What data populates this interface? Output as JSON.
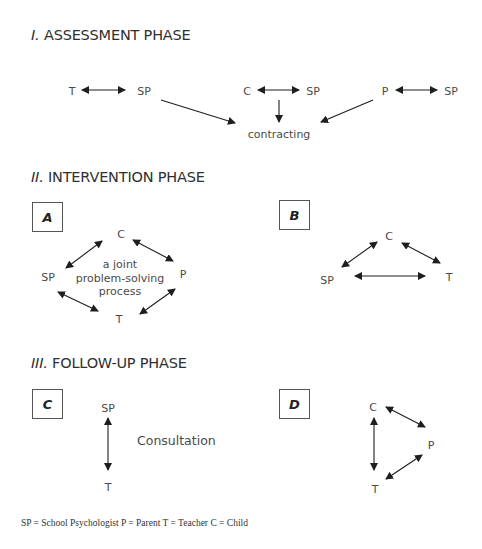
{
  "phases": {
    "assessment": {
      "numeral": "I.",
      "title": "ASSESSMENT PHASE"
    },
    "intervention": {
      "numeral": "II.",
      "title": "INTERVENTION PHASE"
    },
    "followup": {
      "numeral": "III.",
      "title": "FOLLOW-UP PHASE"
    }
  },
  "assessment": {
    "pairs": [
      {
        "left": "T",
        "right": "SP"
      },
      {
        "left": "C",
        "right": "SP"
      },
      {
        "left": "P",
        "right": "SP"
      }
    ],
    "outcome": "contracting"
  },
  "panels": {
    "A": {
      "label": "A",
      "nodes": {
        "top": "C",
        "left": "SP",
        "right": "P",
        "bottom": "T"
      },
      "center_text": [
        "a joint",
        "problem-solving",
        "process"
      ]
    },
    "B": {
      "label": "B",
      "nodes": {
        "top": "C",
        "left": "SP",
        "right": "T"
      }
    },
    "C": {
      "label": "C",
      "nodes": {
        "top": "SP",
        "bottom": "T"
      },
      "side_text": "Consultation"
    },
    "D": {
      "label": "D",
      "nodes": {
        "top": "C",
        "right": "P",
        "bottom": "T"
      }
    }
  },
  "legend": "SP = School Psychologist   P = Parent   T = Teacher   C = Child",
  "colors": {
    "arrow": "#1e1e1e",
    "text": "#3a3a3a",
    "box_border": "#555555"
  }
}
